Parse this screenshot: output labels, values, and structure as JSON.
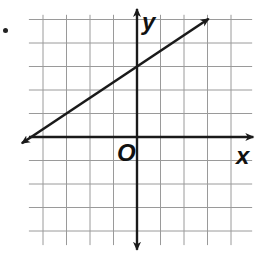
{
  "chart_data": {
    "type": "line",
    "title": "",
    "xlabel": "x",
    "ylabel": "y",
    "origin_label": "O",
    "xlim": [
      -4.5,
      4
    ],
    "ylim": [
      -4.5,
      5
    ],
    "grid": true,
    "grid_step": 1,
    "tick_labels_shown": false,
    "series": [
      {
        "name": "line",
        "equation": "y = (2/3)x + 3",
        "slope": 0.6667,
        "y_intercept": 3,
        "x_intercept": -4.5,
        "points": [
          [
            -4.5,
            0
          ],
          [
            0,
            3
          ],
          [
            3,
            5
          ]
        ],
        "arrows": "both"
      }
    ]
  },
  "labels": {
    "x_axis": "x",
    "y_axis": "y",
    "origin": "O"
  },
  "colors": {
    "grid": "#9a9a9a",
    "axes": "#1a1a1a",
    "line": "#1a1a1a"
  }
}
